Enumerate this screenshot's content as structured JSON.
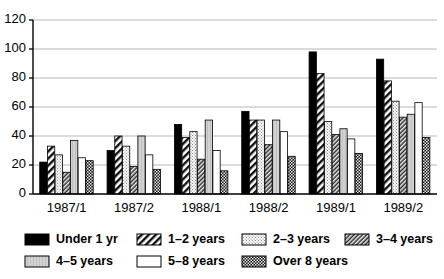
{
  "chart_data": {
    "type": "bar",
    "title": "",
    "subtitle": "",
    "xlabel": "",
    "ylabel": "",
    "categories": [
      "1987/1",
      "1987/2",
      "1988/1",
      "1988/2",
      "1989/1",
      "1989/2"
    ],
    "ylim": [
      0,
      120
    ],
    "yticks": [
      0,
      20,
      40,
      60,
      80,
      100,
      120
    ],
    "ytick_labels": [
      "0",
      "20",
      "40",
      "60",
      "80",
      "100",
      "120"
    ],
    "grid": true,
    "grid_axis": "y",
    "legend_position": "bottom",
    "series": [
      {
        "name": "Under 1 yr",
        "pattern": "solid-black",
        "color": "#000000",
        "values": [
          22,
          30,
          48,
          57,
          98,
          93
        ]
      },
      {
        "name": "1–2 years",
        "pattern": "diagonal-hatch",
        "color": "#ffffff",
        "values": [
          33,
          40,
          39,
          51,
          83,
          78
        ]
      },
      {
        "name": "2–3 years",
        "pattern": "fine-dots",
        "color": "#f2f2f2",
        "values": [
          27,
          33,
          43,
          51,
          50,
          64
        ]
      },
      {
        "name": "3–4 years",
        "pattern": "dense-hatch",
        "color": "#000000",
        "values": [
          15,
          19,
          24,
          34,
          41,
          53
        ]
      },
      {
        "name": "4–5 years",
        "pattern": "light-gray",
        "color": "#cfcfcf",
        "values": [
          37,
          40,
          51,
          51,
          45,
          55
        ]
      },
      {
        "name": "5–8 years",
        "pattern": "empty-white",
        "color": "#ffffff",
        "values": [
          25,
          27,
          30,
          43,
          38,
          63
        ]
      },
      {
        "name": "Over 8 years",
        "pattern": "checker",
        "color": "#000000",
        "values": [
          23,
          17,
          16,
          26,
          28,
          39
        ]
      }
    ]
  },
  "legend": {
    "row1": [
      {
        "label": "Under 1 yr",
        "swatch": "solid-black"
      },
      {
        "label": "1–2 years",
        "swatch": "diagonal-hatch"
      },
      {
        "label": "2–3 years",
        "swatch": "fine-dots"
      },
      {
        "label": "3–4 years",
        "swatch": "dense-hatch"
      }
    ],
    "row2": [
      {
        "label": "4–5 years",
        "swatch": "light-gray"
      },
      {
        "label": "5–8 years",
        "swatch": "empty-white"
      },
      {
        "label": "Over 8 years",
        "swatch": "checker"
      }
    ]
  }
}
